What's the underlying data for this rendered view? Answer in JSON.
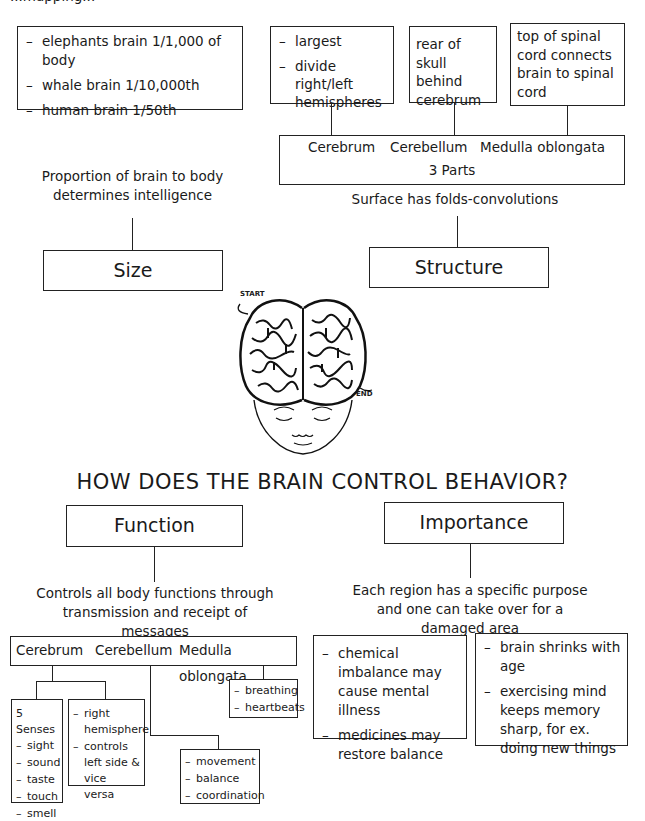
{
  "header": {
    "partial_title": "...mapping..."
  },
  "top": {
    "size_examples": [
      "elephants brain 1/1,000 of body",
      "whale brain 1/10,000th",
      "human brain 1/50th"
    ],
    "cerebrum_notes": [
      "largest",
      "divide right/left hemispheres"
    ],
    "cerebellum_note": "rear of skull behind cerebrum",
    "medulla_note": "top of spinal cord connects brain to spinal cord",
    "parts_box": {
      "parts": [
        "Cerebrum",
        "Cerebellum",
        "Medulla oblongata"
      ],
      "label": "3 Parts"
    },
    "surface_note": "Surface has folds-convolutions",
    "size_note": "Proportion of brain to body determines intelligence",
    "size_label": "Size",
    "structure_label": "Structure"
  },
  "illustration": {
    "start_label": "START",
    "end_label": "END",
    "alt": "brain maze over face"
  },
  "main_question": "HOW DOES THE BRAIN CONTROL BEHAVIOR?",
  "bottom": {
    "function_label": "Function",
    "importance_label": "Importance",
    "function_note": "Controls all body functions through transmission and receipt of messages",
    "importance_note": "Each region has a specific purpose and one can take over for a damaged area",
    "parts_box": [
      "Cerebrum",
      "Cerebellum",
      "Medulla oblongata"
    ],
    "senses": {
      "heading": "5 Senses",
      "items": [
        "sight",
        "sound",
        "taste",
        "touch",
        "smell"
      ]
    },
    "hemisphere": [
      "right hemisphere",
      "controls left side & vice versa"
    ],
    "medulla_items": [
      "breathing",
      "heartbeats"
    ],
    "cerebellum_items": [
      "movement",
      "balance",
      "coordination"
    ],
    "chemical": [
      "chemical imbalance may cause mental illness",
      "medicines may restore balance"
    ],
    "aging": [
      "brain shrinks with age",
      "exercising mind keeps memory sharp, for ex. doing new things"
    ]
  }
}
